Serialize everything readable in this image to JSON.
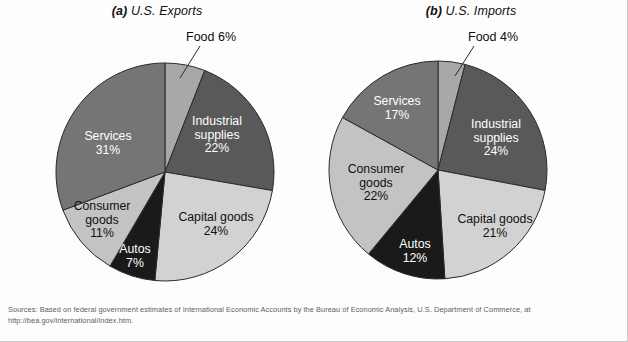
{
  "figure": {
    "background_color": "#fdfdfd",
    "sources": "Sources: Based on federal government estimates of International Economic Accounts by the Bureau of Economic Analysis, U.S. Department of Commerce, at http://bea.gov/international/index.htm."
  },
  "palette": {
    "food": "#a8a8a8",
    "industrial_supplies": "#595959",
    "capital_goods": "#d2d2d2",
    "autos": "#1a1a1a",
    "consumer_goods": "#c3c3c3",
    "services": "#757575",
    "outline": "#2b2b2b",
    "label_on_dark": "#ffffff",
    "label_on_light": "#111111"
  },
  "panels": [
    {
      "label_prefix": "(a)",
      "title": "U.S. Exports",
      "callout": "Food 6%",
      "labels": [
        {
          "name": "industrial-supplies",
          "line1": "Industrial",
          "line2": "supplies",
          "line3": "22%"
        },
        {
          "name": "capital-goods",
          "line1": "Capital goods",
          "line2": "24%",
          "line3": ""
        },
        {
          "name": "autos",
          "line1": "Autos",
          "line2": "7%",
          "line3": ""
        },
        {
          "name": "consumer-goods",
          "line1": "Consumer",
          "line2": "goods",
          "line3": "11%"
        },
        {
          "name": "services",
          "line1": "Services",
          "line2": "31%",
          "line3": ""
        }
      ]
    },
    {
      "label_prefix": "(b)",
      "title": "U.S. Imports",
      "callout": "Food 4%",
      "labels": [
        {
          "name": "industrial-supplies",
          "line1": "Industrial",
          "line2": "supplies",
          "line3": "24%"
        },
        {
          "name": "capital-goods",
          "line1": "Capital goods",
          "line2": "21%",
          "line3": ""
        },
        {
          "name": "autos",
          "line1": "Autos",
          "line2": "12%",
          "line3": ""
        },
        {
          "name": "consumer-goods",
          "line1": "Consumer",
          "line2": "goods",
          "line3": "22%"
        },
        {
          "name": "services",
          "line1": "Services",
          "line2": "17%",
          "line3": ""
        }
      ]
    }
  ],
  "chart_data": [
    {
      "type": "pie",
      "title": "(a) U.S. Exports",
      "start_angle_deg": 0,
      "direction": "clockwise",
      "labels": [
        "Food",
        "Industrial supplies",
        "Capital goods",
        "Autos",
        "Consumer goods",
        "Services"
      ],
      "values": [
        6,
        22,
        24,
        7,
        11,
        31
      ],
      "value_unit": "%",
      "colors": [
        "#a8a8a8",
        "#595959",
        "#d2d2d2",
        "#1a1a1a",
        "#c3c3c3",
        "#757575"
      ],
      "annotations": [
        "Food 6%"
      ],
      "legend": "none"
    },
    {
      "type": "pie",
      "title": "(b) U.S. Imports",
      "start_angle_deg": 0,
      "direction": "clockwise",
      "labels": [
        "Food",
        "Industrial supplies",
        "Capital goods",
        "Autos",
        "Consumer goods",
        "Services"
      ],
      "values": [
        4,
        24,
        21,
        12,
        22,
        17
      ],
      "value_unit": "%",
      "colors": [
        "#a8a8a8",
        "#595959",
        "#d2d2d2",
        "#1a1a1a",
        "#c3c3c3",
        "#757575"
      ],
      "annotations": [
        "Food 4%"
      ],
      "legend": "none"
    }
  ]
}
